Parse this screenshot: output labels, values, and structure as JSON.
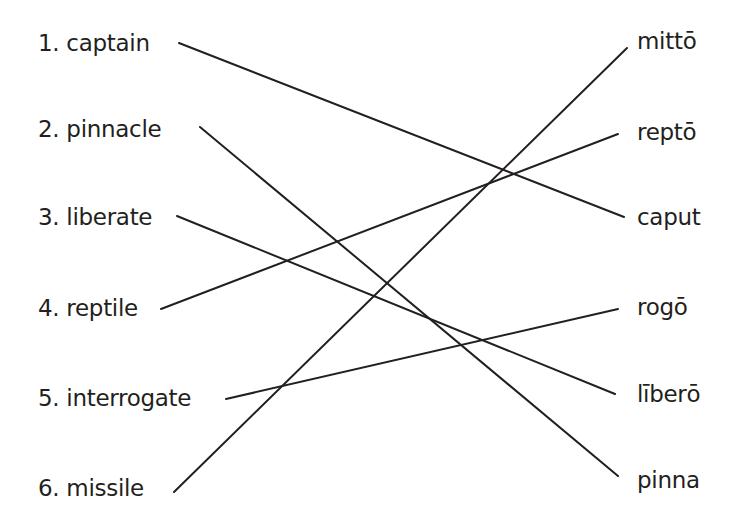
{
  "left_terms": [
    {
      "label": "1. captain",
      "x": 38,
      "y": 32
    },
    {
      "label": "2. pinnacle",
      "x": 38,
      "y": 118
    },
    {
      "label": "3. liberate",
      "x": 38,
      "y": 206
    },
    {
      "label": "4. reptile",
      "x": 38,
      "y": 297
    },
    {
      "label": "5. interrogate",
      "x": 38,
      "y": 387
    },
    {
      "label": "6. missile",
      "x": 38,
      "y": 477
    }
  ],
  "right_terms": [
    {
      "label": "mittō",
      "x": 637,
      "y": 30
    },
    {
      "label": "reptō",
      "x": 637,
      "y": 121
    },
    {
      "label": "caput",
      "x": 637,
      "y": 206
    },
    {
      "label": "rogō",
      "x": 637,
      "y": 296
    },
    {
      "label": "līberō",
      "x": 637,
      "y": 383
    },
    {
      "label": "pinna",
      "x": 637,
      "y": 469
    }
  ],
  "links": [
    {
      "from": "1. captain",
      "to": "caput",
      "x1": 179,
      "y1": 43,
      "x2": 624,
      "y2": 217
    },
    {
      "from": "2. pinnacle",
      "to": "pinna",
      "x1": 200,
      "y1": 127,
      "x2": 618,
      "y2": 476
    },
    {
      "from": "3. liberate",
      "to": "līberō",
      "x1": 177,
      "y1": 216,
      "x2": 615,
      "y2": 394
    },
    {
      "from": "4. reptile",
      "to": "reptō",
      "x1": 161,
      "y1": 309,
      "x2": 618,
      "y2": 134
    },
    {
      "from": "5. interrogate",
      "to": "rogō",
      "x1": 226,
      "y1": 399,
      "x2": 618,
      "y2": 309
    },
    {
      "from": "6. missile",
      "to": "mittō",
      "x1": 174,
      "y1": 492,
      "x2": 627,
      "y2": 48
    }
  ],
  "colors": {
    "ink": "#231f20",
    "background": "#ffffff"
  }
}
